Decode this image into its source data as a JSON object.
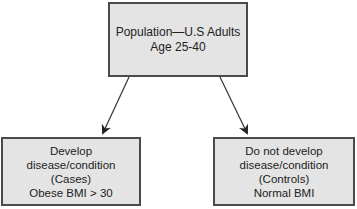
{
  "diagram": {
    "type": "flowchart",
    "nodes": {
      "population": {
        "lines": [
          "Population—U.S Adults",
          "Age 25-40"
        ]
      },
      "cases": {
        "lines": [
          "Develop",
          "disease/condition",
          "(Cases)",
          "Obese BMI > 30"
        ]
      },
      "controls": {
        "lines": [
          "Do not develop",
          "disease/condition",
          "(Controls)",
          "Normal BMI"
        ]
      }
    },
    "edges": [
      {
        "from": "population",
        "to": "cases"
      },
      {
        "from": "population",
        "to": "controls"
      }
    ],
    "colors": {
      "box_fill": "#e4e4e4",
      "box_border": "#4a4a4a",
      "arrow": "#222222",
      "text": "#222222"
    }
  }
}
